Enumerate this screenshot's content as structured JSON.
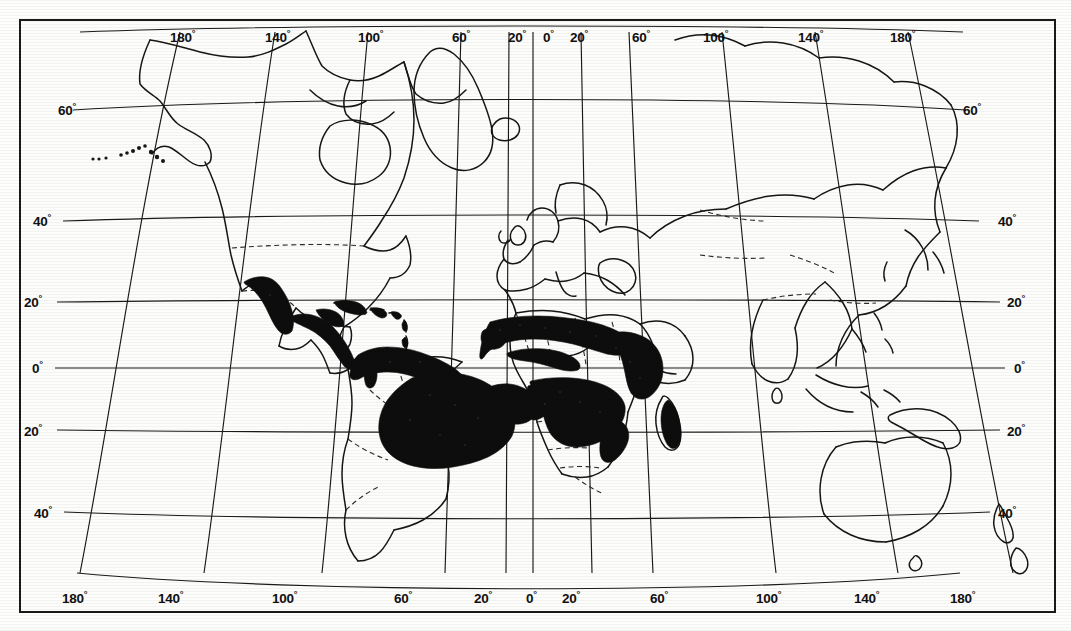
{
  "map": {
    "title": "World distribution map",
    "description": "Scanned black-and-white world map with graticule, shaded (solid black) distribution areas in tropical Latin America, sub-Saharan Africa and eastern Madagascar.",
    "projection": "curved pseudo-conic graticule",
    "background_color": "#fdfdfb",
    "ink_color": "#111111",
    "shade_color": "#0d0d0d",
    "frame": {
      "x": 19,
      "y": 19,
      "width": 1037,
      "height": 594,
      "border_width": 2.5
    },
    "graticule": {
      "longitude_step_deg": 20,
      "latitude_step_deg": 20,
      "longitude_range_deg": [
        -180,
        180
      ],
      "latitude_range_deg": [
        -60,
        80
      ]
    },
    "axis_labels": {
      "top": [
        {
          "text": "180",
          "deg": "°",
          "x": 170,
          "y": 27
        },
        {
          "text": "140",
          "deg": "°",
          "x": 265,
          "y": 27
        },
        {
          "text": "100",
          "deg": "°",
          "x": 358,
          "y": 27
        },
        {
          "text": "60",
          "deg": "°",
          "x": 452,
          "y": 27
        },
        {
          "text": "20",
          "deg": "°",
          "x": 510,
          "y": 27
        },
        {
          "text": "0",
          "deg": "°",
          "x": 540,
          "y": 27
        },
        {
          "text": "20",
          "deg": "°",
          "x": 572,
          "y": 27
        },
        {
          "text": "60",
          "deg": "°",
          "x": 636,
          "y": 27
        },
        {
          "text": "100",
          "deg": "°",
          "x": 711,
          "y": 27
        },
        {
          "text": "140",
          "deg": "°",
          "x": 806,
          "y": 27
        },
        {
          "text": "180",
          "deg": "°",
          "x": 900,
          "y": 27
        }
      ],
      "bottom": [
        {
          "text": "180",
          "deg": "°",
          "x": 66,
          "y": 589
        },
        {
          "text": "140",
          "deg": "°",
          "x": 160,
          "y": 589
        },
        {
          "text": "100",
          "deg": "°",
          "x": 278,
          "y": 589
        },
        {
          "text": "60",
          "deg": "°",
          "x": 398,
          "y": 589
        },
        {
          "text": "20",
          "deg": "°",
          "x": 479,
          "y": 589
        },
        {
          "text": "0",
          "deg": "°",
          "x": 528,
          "y": 589
        },
        {
          "text": "20",
          "deg": "°",
          "x": 568,
          "y": 589
        },
        {
          "text": "60",
          "deg": "°",
          "x": 655,
          "y": 589
        },
        {
          "text": "100",
          "deg": "°",
          "x": 762,
          "y": 589
        },
        {
          "text": "140",
          "deg": "°",
          "x": 862,
          "y": 589
        },
        {
          "text": "180",
          "deg": "°",
          "x": 958,
          "y": 589
        }
      ],
      "left": [
        {
          "text": "60",
          "deg": "°",
          "x": 62,
          "y": 101
        },
        {
          "text": "40",
          "deg": "°",
          "x": 35,
          "y": 211
        },
        {
          "text": "20",
          "deg": "°",
          "x": 24,
          "y": 293
        },
        {
          "text": "0",
          "deg": "°",
          "x": 33,
          "y": 360
        },
        {
          "text": "20",
          "deg": "°",
          "x": 24,
          "y": 423
        },
        {
          "text": "40",
          "deg": "°",
          "x": 35,
          "y": 507
        }
      ],
      "right": [
        {
          "text": "60",
          "deg": "°",
          "x": 965,
          "y": 101
        },
        {
          "text": "40",
          "deg": "°",
          "x": 1001,
          "y": 211
        },
        {
          "text": "20",
          "deg": "°",
          "x": 1011,
          "y": 293
        },
        {
          "text": "0",
          "deg": "°",
          "x": 1020,
          "y": 360
        },
        {
          "text": "20",
          "deg": "°",
          "x": 1011,
          "y": 423
        },
        {
          "text": "40",
          "deg": "°",
          "x": 1001,
          "y": 507
        }
      ]
    },
    "shaded_regions": [
      {
        "name": "western-mexico",
        "label": "Western Mexico / Sierra Madre"
      },
      {
        "name": "central-america",
        "label": "Central America"
      },
      {
        "name": "caribbean-antilles",
        "label": "Greater & Lesser Antilles"
      },
      {
        "name": "northern-south-america",
        "label": "Colombia / Venezuela / Guianas"
      },
      {
        "name": "amazon-brazil",
        "label": "Amazon Basin & eastern Brazil"
      },
      {
        "name": "sahel-west-africa",
        "label": "Sahel & West Africa belt"
      },
      {
        "name": "east-africa",
        "label": "East Africa / Horn highlands"
      },
      {
        "name": "central-southern-africa",
        "label": "Congo / Zambezi / Mozambique"
      },
      {
        "name": "madagascar-east",
        "label": "Eastern Madagascar"
      }
    ],
    "unshaded_regions": [
      {
        "name": "north-america",
        "label": "North America"
      },
      {
        "name": "europe",
        "label": "Europe"
      },
      {
        "name": "asia",
        "label": "Asia"
      },
      {
        "name": "australia",
        "label": "Australia"
      },
      {
        "name": "new-zealand",
        "label": "New Zealand"
      },
      {
        "name": "southern-south-america",
        "label": "Southern Cone"
      },
      {
        "name": "sahara-north-africa",
        "label": "Sahara / North Africa"
      },
      {
        "name": "south-africa",
        "label": "South Africa"
      }
    ]
  }
}
